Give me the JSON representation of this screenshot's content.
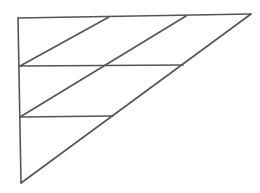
{
  "diagram": {
    "type": "geometric-figure",
    "stroke_color": "#555555",
    "background_color": "#ffffff",
    "vertices": {
      "top_left": [
        18,
        18
      ],
      "top_right": [
        251,
        14
      ],
      "bottom_left": [
        21,
        183
      ]
    },
    "lines": [
      {
        "id": "top-edge",
        "from": [
          18,
          18
        ],
        "to": [
          251,
          14
        ]
      },
      {
        "id": "left-edge",
        "from": [
          18,
          18
        ],
        "to": [
          21,
          183
        ]
      },
      {
        "id": "hypotenuse",
        "from": [
          21,
          183
        ],
        "to": [
          251,
          14
        ]
      },
      {
        "id": "horizontal-1",
        "from": [
          20,
          66
        ],
        "to": [
          183,
          65
        ]
      },
      {
        "id": "horizontal-2",
        "from": [
          20,
          117
        ],
        "to": [
          113,
          116
        ]
      },
      {
        "id": "diagonal-1",
        "from": [
          20,
          66
        ],
        "to": [
          109,
          17
        ]
      },
      {
        "id": "diagonal-2",
        "from": [
          20,
          117
        ],
        "to": [
          186,
          16
        ]
      }
    ]
  }
}
